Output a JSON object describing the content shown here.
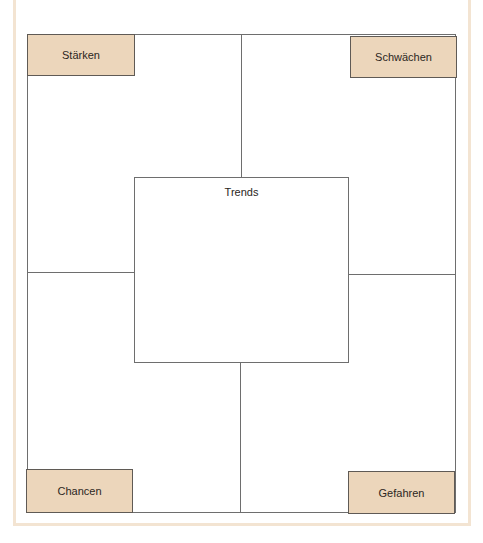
{
  "diagram": {
    "type": "swot-template",
    "quadrants": {
      "top_left": {
        "label": "Stärken"
      },
      "top_right": {
        "label": "Schwächen"
      },
      "bottom_left": {
        "label": "Chancen"
      },
      "bottom_right": {
        "label": "Gefahren"
      }
    },
    "center": {
      "label": "Trends"
    },
    "colors": {
      "label_fill": "#ecd6bb",
      "frame": "#f3e4d2",
      "lines": "#6e6e6e"
    }
  }
}
